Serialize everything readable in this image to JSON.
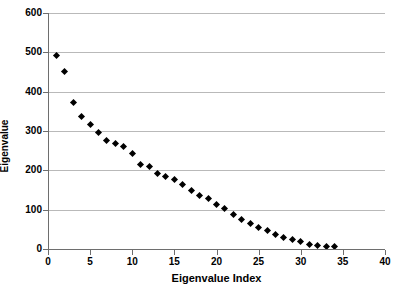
{
  "chart_data": {
    "type": "scatter",
    "title": "",
    "xlabel": "Eigenvalue Index",
    "ylabel": "Eigenvalue",
    "xlim": [
      0,
      40
    ],
    "ylim": [
      0,
      600
    ],
    "xticks": [
      0,
      5,
      10,
      15,
      20,
      25,
      30,
      35,
      40
    ],
    "yticks": [
      0,
      100,
      200,
      300,
      400,
      500,
      600
    ],
    "grid": "horizontal",
    "legend": null,
    "marker": "filled-diamond",
    "marker_color": "#000000",
    "x": [
      1,
      2,
      3,
      4,
      5,
      6,
      7,
      8,
      9,
      10,
      11,
      12,
      13,
      14,
      15,
      16,
      17,
      18,
      19,
      20,
      21,
      22,
      23,
      24,
      25,
      26,
      27,
      28,
      29,
      30,
      31,
      32,
      33,
      34
    ],
    "values": [
      492,
      452,
      372,
      336,
      317,
      297,
      276,
      267,
      261,
      242,
      216,
      209,
      192,
      185,
      176,
      163,
      149,
      135,
      128,
      113,
      102,
      87,
      75,
      65,
      54,
      46,
      38,
      30,
      23,
      18,
      12,
      9,
      7,
      6
    ],
    "annotations": []
  },
  "axis": {
    "x_title": "Eigenvalue Index",
    "y_title": "Eigenvalue",
    "x_tick_labels": [
      "0",
      "5",
      "10",
      "15",
      "20",
      "25",
      "30",
      "35",
      "40"
    ],
    "y_tick_labels": [
      "0",
      "100",
      "200",
      "300",
      "400",
      "500",
      "600"
    ]
  },
  "colors": {
    "marker": "#000000",
    "gridline": "#b9b9b9",
    "axis": "#6e6e6e",
    "background": "#ffffff"
  }
}
